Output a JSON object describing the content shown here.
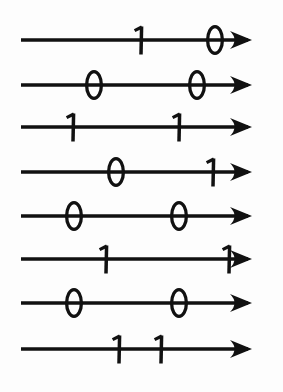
{
  "figure": {
    "colors": {
      "ink": "#111111",
      "background": "#fdfdfd"
    },
    "line": {
      "start_x": 21,
      "arrow_tip_x": 252,
      "stroke_width": 3.4,
      "arrowhead_length": 22,
      "arrowhead_half_height": 9
    },
    "rows": [
      {
        "index": 1,
        "center_y": 40,
        "digits": [
          {
            "value": "1",
            "x": 141
          },
          {
            "value": "0",
            "x": 215
          }
        ]
      },
      {
        "index": 2,
        "center_y": 85,
        "digits": [
          {
            "value": "0",
            "x": 94
          },
          {
            "value": "0",
            "x": 197
          }
        ]
      },
      {
        "index": 3,
        "center_y": 127,
        "digits": [
          {
            "value": "1",
            "x": 73
          },
          {
            "value": "1",
            "x": 179
          }
        ]
      },
      {
        "index": 4,
        "center_y": 172,
        "digits": [
          {
            "value": "0",
            "x": 116
          },
          {
            "value": "1",
            "x": 213
          }
        ]
      },
      {
        "index": 5,
        "center_y": 216,
        "digits": [
          {
            "value": "0",
            "x": 74
          },
          {
            "value": "0",
            "x": 179
          }
        ]
      },
      {
        "index": 6,
        "center_y": 259,
        "digits": [
          {
            "value": "1",
            "x": 106
          },
          {
            "value": "1",
            "x": 229
          }
        ]
      },
      {
        "index": 7,
        "center_y": 303,
        "digits": [
          {
            "value": "0",
            "x": 74
          },
          {
            "value": "0",
            "x": 179
          }
        ]
      },
      {
        "index": 8,
        "center_y": 349,
        "digits": [
          {
            "value": "1",
            "x": 119
          },
          {
            "value": "1",
            "x": 161
          }
        ]
      }
    ]
  }
}
